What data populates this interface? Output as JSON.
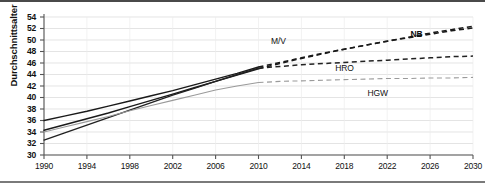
{
  "chart_data": {
    "type": "line",
    "title": "",
    "xlabel": "",
    "ylabel": "Durchschnittsalter",
    "xlim": [
      1990,
      2030
    ],
    "ylim": [
      30,
      54
    ],
    "ytick_step": 2,
    "xtick_step": 4,
    "grid": true,
    "legend_position": "inline-annotations",
    "xticks": [
      "1990",
      "1994",
      "1998",
      "2002",
      "2006",
      "2010",
      "2014",
      "2018",
      "2022",
      "2026",
      "2030"
    ],
    "yticks": [
      "30",
      "32",
      "34",
      "36",
      "38",
      "40",
      "42",
      "44",
      "46",
      "48",
      "50",
      "52",
      "54"
    ],
    "x": [
      1990,
      1992,
      1994,
      1996,
      1998,
      2000,
      2002,
      2004,
      2006,
      2008,
      2010,
      2012,
      2014,
      2016,
      2018,
      2020,
      2022,
      2024,
      2026,
      2028,
      2030
    ],
    "series": [
      {
        "name": "M/V",
        "label": "M/V",
        "color": "#1a1a1a",
        "solid_until": 2010,
        "values": [
          36.0,
          36.8,
          37.6,
          38.5,
          39.4,
          40.3,
          41.2,
          42.2,
          43.2,
          44.2,
          45.3,
          46.1,
          46.9,
          47.7,
          48.4,
          49.1,
          49.8,
          50.4,
          51.0,
          51.6,
          52.1
        ]
      },
      {
        "name": "NB",
        "label": "NB",
        "color": "#1a1a1a",
        "solid_until": 2010,
        "values": [
          34.3,
          35.3,
          36.3,
          37.3,
          38.4,
          39.5,
          40.6,
          41.7,
          42.8,
          43.9,
          45.0,
          45.9,
          46.8,
          47.6,
          48.4,
          49.1,
          49.8,
          50.5,
          51.2,
          51.8,
          52.4
        ]
      },
      {
        "name": "HRO",
        "label": "HRO",
        "color": "#222222",
        "solid_until": 2010,
        "values": [
          32.6,
          33.9,
          35.2,
          36.5,
          37.8,
          39.1,
          40.4,
          41.6,
          42.8,
          44.0,
          45.1,
          45.4,
          45.7,
          45.9,
          46.1,
          46.3,
          46.5,
          46.7,
          46.9,
          47.1,
          47.2
        ]
      },
      {
        "name": "HGW",
        "label": "HGW",
        "color": "#9a9a9a",
        "solid_until": 2010,
        "values": [
          34.0,
          34.9,
          35.8,
          36.7,
          37.7,
          38.6,
          39.5,
          40.4,
          41.3,
          42.0,
          42.6,
          42.8,
          42.9,
          43.0,
          43.1,
          43.2,
          43.3,
          43.3,
          43.4,
          43.4,
          43.5
        ]
      }
    ],
    "annotations": [
      {
        "text": "M/V",
        "x": 2012,
        "y": 49.6
      },
      {
        "text": "NB",
        "x": 2025,
        "y": 50.8
      },
      {
        "text": "HRO",
        "x": 2018,
        "y": 44.9
      },
      {
        "text": "HGW",
        "x": 2021,
        "y": 40.6
      }
    ]
  },
  "axis": {
    "y_title": "Durchschnittsalter"
  }
}
